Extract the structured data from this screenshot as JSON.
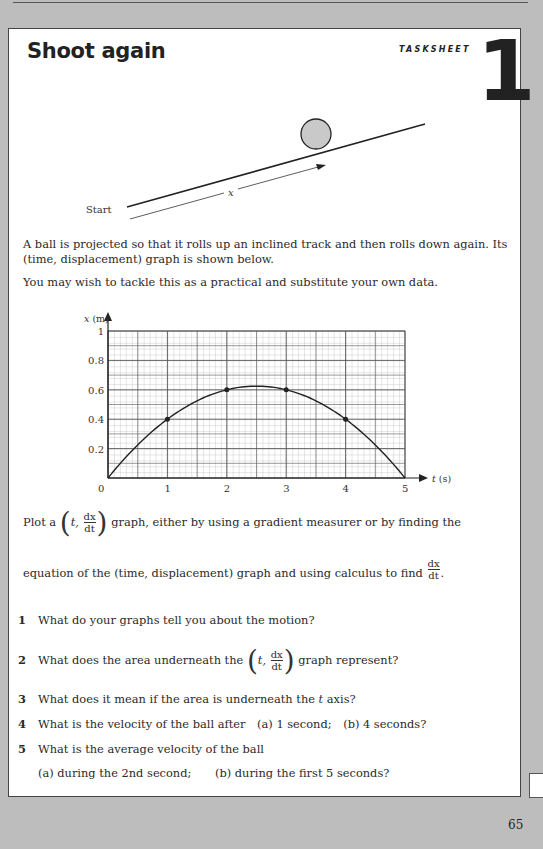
{
  "header": {
    "title": "Shoot again",
    "label": "TASKSHEET",
    "number": "1"
  },
  "diagram": {
    "start_label": "Start",
    "distance_label": "x",
    "ball_fill": "#c9c9c9"
  },
  "intro": {
    "line1": "A ball is projected so that it rolls up an inclined track and then rolls down again. Its",
    "line2": "(time, displacement) graph is shown below.",
    "line3": "You may wish to tackle this as a practical and substitute your own data."
  },
  "chart_data": {
    "type": "line",
    "title": "",
    "xlabel": "t (s)",
    "ylabel": "x (m)",
    "xlim": [
      0,
      5
    ],
    "ylim": [
      0,
      1
    ],
    "x_ticks": [
      "0",
      "1",
      "2",
      "3",
      "4",
      "5"
    ],
    "y_ticks": [
      "0.2",
      "0.4",
      "0.6",
      "0.8",
      "1"
    ],
    "grid": true,
    "series": [
      {
        "name": "displacement",
        "x": [
          0,
          0.5,
          1,
          1.5,
          2,
          2.5,
          3,
          3.5,
          4,
          4.5,
          5
        ],
        "values": [
          0,
          0.225,
          0.4,
          0.525,
          0.6,
          0.625,
          0.6,
          0.525,
          0.4,
          0.225,
          0
        ]
      }
    ],
    "marked_points": [
      {
        "t": 1,
        "x": 0.4
      },
      {
        "t": 2,
        "x": 0.6
      },
      {
        "t": 3,
        "x": 0.6
      },
      {
        "t": 4,
        "x": 0.4
      }
    ]
  },
  "instructions": {
    "plot_pre": "Plot a",
    "plot_t": "t,",
    "frac_num": "dx",
    "frac_den": "dt",
    "plot_post": "graph, either by using a gradient measurer or by finding the",
    "line2_pre": "equation of the (time, displacement) graph and using calculus to find",
    "line2_post": "."
  },
  "questions": [
    {
      "num": "1",
      "text": "What do your graphs tell you about the motion?"
    },
    {
      "num": "2",
      "pre": "What does the area underneath the",
      "t": "t,",
      "post": "graph represent?"
    },
    {
      "num": "3",
      "pre": "What does it mean if the area is underneath the",
      "t": "t",
      "post": "axis?"
    },
    {
      "num": "4",
      "text": "What is the velocity of the ball after",
      "a": "(a)  1 second;",
      "b": "(b)  4 seconds?"
    },
    {
      "num": "5",
      "text": "What is the average velocity of the ball",
      "a": "(a)  during the 2nd second;",
      "b": "(b)  during the first 5 seconds?"
    }
  ],
  "footer": {
    "page_number": "65"
  }
}
